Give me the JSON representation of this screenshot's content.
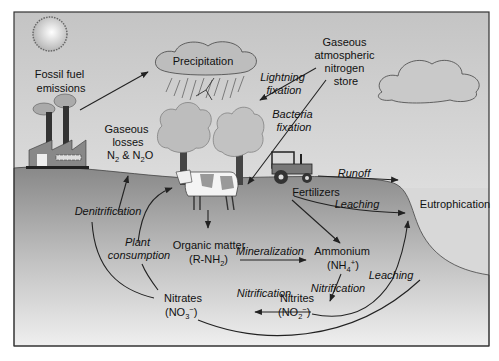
{
  "diagram": {
    "colors": {
      "sky_top": "#c9c9c9",
      "sky_bottom": "#f2f2f2",
      "ground_top": "#8a8a8a",
      "ground_bottom": "#f0f0f0",
      "water": "#d9d9d9",
      "frame": "#333333"
    },
    "nodes": {
      "fossil_fuel": {
        "line1": "Fossil fuel",
        "line2": "emissions"
      },
      "precipitation": {
        "label": "Precipitation"
      },
      "atmospheric_store": {
        "line1": "Gaseous",
        "line2": "atmospheric",
        "line3": "nitrogen",
        "line4": "store"
      },
      "gaseous_losses": {
        "line1": "Gaseous",
        "line2": "losses",
        "line3_a": "N",
        "line3_sub1": "2",
        "line3_b": " & N",
        "line3_sub2": "2",
        "line3_c": "O"
      },
      "fertilizers": {
        "label": "Fertilizers"
      },
      "eutrophication": {
        "label": "Eutrophication"
      },
      "organic_matter": {
        "line1": "Organic matter",
        "line2_a": "(R-NH",
        "line2_sub": "2",
        "line2_b": ")"
      },
      "ammonium": {
        "line1": "Ammonium",
        "line2_a": "(NH",
        "line2_sub": "4",
        "line2_sup": "+",
        "line2_b": ")"
      },
      "nitrites": {
        "line1": "Nitrites",
        "line2_a": "(NO",
        "line2_sub": "2",
        "line2_sup": "−",
        "line2_b": ")"
      },
      "nitrates": {
        "line1": "Nitrates",
        "line2_a": "(NO",
        "line2_sub": "3",
        "line2_sup": "−",
        "line2_b": ")"
      }
    },
    "processes": {
      "lightning_fixation": {
        "line1": "Lightning",
        "line2": "fixation"
      },
      "bacteria_fixation": {
        "line1": "Bacteria",
        "line2": "fixation"
      },
      "runoff": "Runoff",
      "leaching_top": "Leaching",
      "leaching_bottom": "Leaching",
      "denitrification": "Denitrification",
      "plant_consumption": {
        "line1": "Plant",
        "line2": "consumption"
      },
      "mineralization": "Mineralization",
      "nitrification_1": "Nitrification",
      "nitrification_2": "Nitrification"
    },
    "illustrations": [
      "sun-icon",
      "factory-icon",
      "rain-cloud-icon",
      "cloud-icon",
      "tree-icon",
      "tree-icon",
      "cow-icon",
      "tractor-icon"
    ]
  }
}
